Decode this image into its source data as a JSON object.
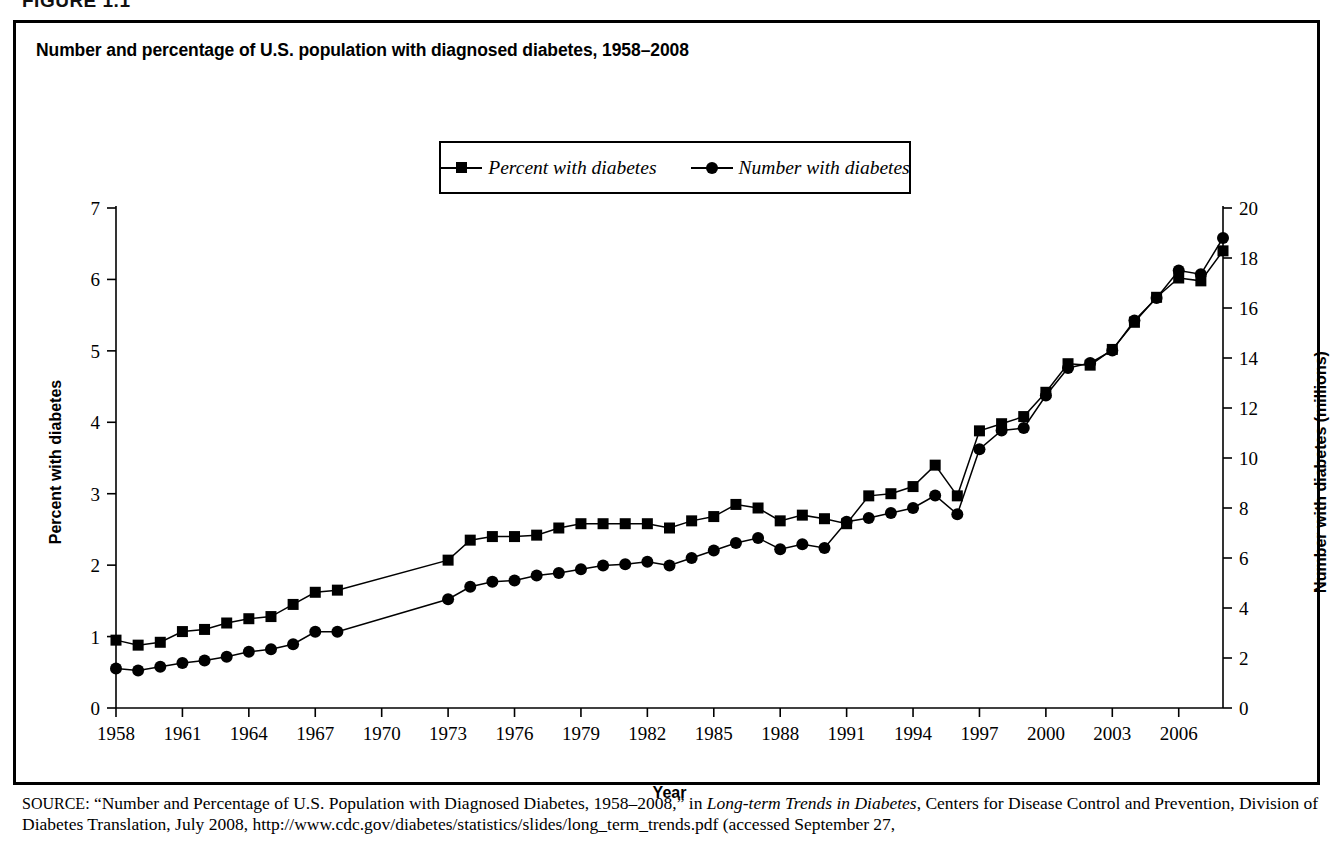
{
  "figure": {
    "tag": "FIGURE 1.1",
    "title": "Number and percentage of U.S. population with diagnosed diabetes, 1958–2008"
  },
  "legend": {
    "position": "top-center",
    "entries": [
      {
        "label": "Percent with diabetes",
        "marker": "square-marker-icon"
      },
      {
        "label": "Number with diabetes",
        "marker": "circle-marker-icon"
      }
    ]
  },
  "axes": {
    "x": {
      "label": "Year",
      "ticks": [
        "1958",
        "1961",
        "1964",
        "1967",
        "1970",
        "1973",
        "1976",
        "1979",
        "1982",
        "1985",
        "1988",
        "1991",
        "1994",
        "1997",
        "2000",
        "2003",
        "2006"
      ],
      "range": [
        1958,
        2008
      ]
    },
    "y_left": {
      "label": "Percent with diabetes",
      "ticks": [
        "0",
        "1",
        "2",
        "3",
        "4",
        "5",
        "6",
        "7"
      ],
      "range": [
        0,
        7
      ]
    },
    "y_right": {
      "label": "Number with diabetes (millions)",
      "ticks": [
        "0",
        "2",
        "4",
        "6",
        "8",
        "10",
        "12",
        "14",
        "16",
        "18",
        "20"
      ],
      "range": [
        0,
        20
      ]
    }
  },
  "source": {
    "keyword": "SOURCE:",
    "line1_a": " “Number and Percentage of U.S. Population with Diagnosed Diabetes, 1958–2008,” in ",
    "line1_italic": "Long-term Trends in Diabetes",
    "line1_b": ", Centers for Disease Control",
    "line2": "and Prevention, Division of Diabetes Translation, July 2008, http://www.cdc.gov/diabetes/statistics/slides/long_term_trends.pdf (accessed September 27,"
  },
  "colors": {
    "line": "#000000",
    "background": "#ffffff",
    "border": "#000000"
  },
  "chart_data": {
    "type": "line",
    "title": "Number and percentage of U.S. population with diagnosed diabetes, 1958–2008",
    "xlabel": "Year",
    "ylabel": "Percent with diabetes",
    "y2label": "Number with diabetes (millions)",
    "xlim": [
      1958,
      2008
    ],
    "ylim": [
      0,
      7
    ],
    "y2lim": [
      0,
      20
    ],
    "grid": false,
    "legend_position": "top-center",
    "x": [
      1958,
      1959,
      1960,
      1961,
      1962,
      1963,
      1964,
      1965,
      1966,
      1967,
      1968,
      1973,
      1974,
      1975,
      1976,
      1977,
      1978,
      1979,
      1980,
      1981,
      1982,
      1983,
      1984,
      1985,
      1986,
      1987,
      1988,
      1989,
      1990,
      1991,
      1992,
      1993,
      1994,
      1995,
      1996,
      1997,
      1998,
      1999,
      2000,
      2001,
      2002,
      2003,
      2004,
      2005,
      2006,
      2007,
      2008
    ],
    "series": [
      {
        "name": "Percent with diabetes",
        "axis": "left",
        "marker": "square",
        "units": "percent",
        "values": [
          0.95,
          0.88,
          0.92,
          1.07,
          1.1,
          1.19,
          1.25,
          1.28,
          1.45,
          1.62,
          1.65,
          2.07,
          2.35,
          2.4,
          2.4,
          2.42,
          2.52,
          2.58,
          2.58,
          2.58,
          2.58,
          2.52,
          2.62,
          2.68,
          2.85,
          2.8,
          2.62,
          2.7,
          2.65,
          2.58,
          2.97,
          3.0,
          3.1,
          3.4,
          2.97,
          3.88,
          3.98,
          4.08,
          4.42,
          4.82,
          4.8,
          5.02,
          5.4,
          5.75,
          6.02,
          5.98,
          6.4
        ]
      },
      {
        "name": "Number with diabetes",
        "axis": "right",
        "marker": "circle",
        "units": "millions",
        "values": [
          1.58,
          1.5,
          1.65,
          1.8,
          1.9,
          2.05,
          2.25,
          2.35,
          2.55,
          3.05,
          3.05,
          4.35,
          4.85,
          5.05,
          5.1,
          5.3,
          5.4,
          5.55,
          5.7,
          5.75,
          5.85,
          5.7,
          6.0,
          6.3,
          6.6,
          6.8,
          6.35,
          6.55,
          6.4,
          7.45,
          7.6,
          7.8,
          8.0,
          8.5,
          7.75,
          10.35,
          11.1,
          11.2,
          12.5,
          13.6,
          13.8,
          14.3,
          15.5,
          16.4,
          17.5,
          17.35,
          18.8
        ]
      }
    ]
  }
}
